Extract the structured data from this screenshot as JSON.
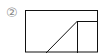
{
  "figure": {
    "label": "②",
    "stroke_color": "#111111",
    "label_color": "#888888"
  }
}
